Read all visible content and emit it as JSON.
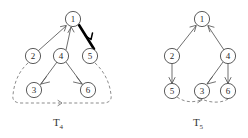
{
  "figure": {
    "background_color": "#ffffff",
    "ink_color": "#555555",
    "bold_edge_color": "#000000",
    "dashed_edge_color": "#777777",
    "diagrams": [
      {
        "id": "left",
        "caption_base": "T",
        "caption_subscript": "4",
        "caption_full": "T4",
        "nodes": [
          {
            "id": "n1",
            "label": "1",
            "cx": 73,
            "cy": 19
          },
          {
            "id": "n2",
            "label": "2",
            "cx": 33,
            "cy": 56
          },
          {
            "id": "n4",
            "label": "4",
            "cx": 61,
            "cy": 56
          },
          {
            "id": "n5",
            "label": "5",
            "cx": 90,
            "cy": 56
          },
          {
            "id": "n3",
            "label": "3",
            "cx": 34,
            "cy": 90
          },
          {
            "id": "n6",
            "label": "6",
            "cx": 88,
            "cy": 90
          }
        ],
        "edges": [
          {
            "from": "2",
            "to": "1",
            "style": "solid",
            "direction": "up-right"
          },
          {
            "from": "4",
            "to": "1",
            "style": "solid",
            "direction": "up"
          },
          {
            "from": "1",
            "to": "5",
            "style": "bold",
            "direction": "down-right"
          },
          {
            "from": "4",
            "to": "3",
            "style": "solid",
            "direction": "down-left"
          },
          {
            "from": "4",
            "to": "6",
            "style": "solid",
            "direction": "down-right"
          },
          {
            "from": "2",
            "to": "loop-left",
            "style": "dashed",
            "direction": "down"
          },
          {
            "from": "5",
            "to": "loop-right",
            "style": "dashed",
            "direction": "down"
          },
          {
            "from": "loop",
            "to": "bottom",
            "style": "dashed",
            "direction": "left"
          }
        ]
      },
      {
        "id": "right",
        "caption_base": "T",
        "caption_subscript": "5",
        "caption_full": "T5",
        "nodes": [
          {
            "id": "n1",
            "label": "1",
            "cx": 202,
            "cy": 19
          },
          {
            "id": "n2",
            "label": "2",
            "cx": 172,
            "cy": 56
          },
          {
            "id": "n4",
            "label": "4",
            "cx": 228,
            "cy": 56
          },
          {
            "id": "n5",
            "label": "5",
            "cx": 172,
            "cy": 91
          },
          {
            "id": "n3",
            "label": "3",
            "cx": 202,
            "cy": 91
          },
          {
            "id": "n6",
            "label": "6",
            "cx": 228,
            "cy": 91
          }
        ],
        "edges": [
          {
            "from": "2",
            "to": "1",
            "style": "solid",
            "direction": "up-right"
          },
          {
            "from": "4",
            "to": "1",
            "style": "solid",
            "direction": "up-left"
          },
          {
            "from": "2",
            "to": "5",
            "style": "solid",
            "direction": "down"
          },
          {
            "from": "4",
            "to": "3",
            "style": "solid",
            "direction": "down-left"
          },
          {
            "from": "4",
            "to": "6",
            "style": "solid",
            "direction": "down"
          },
          {
            "from": "5",
            "to": "3",
            "style": "dashed",
            "direction": "right"
          },
          {
            "from": "6",
            "to": "3",
            "style": "dashed",
            "direction": "left"
          }
        ]
      }
    ]
  }
}
